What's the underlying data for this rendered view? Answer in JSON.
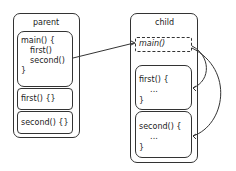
{
  "parent": {
    "title": "parent",
    "main_block": {
      "lines": [
        "main() {",
        "  first()",
        "  second()",
        "}"
      ]
    },
    "first_block": "first() {}",
    "second_block": "second() {}"
  },
  "child": {
    "title": "child",
    "main_block": "main()",
    "first_block": {
      "lines": [
        "first() {",
        "  ...",
        "}"
      ]
    },
    "second_block": {
      "lines": [
        "second() {",
        "  ...",
        "}"
      ]
    }
  }
}
